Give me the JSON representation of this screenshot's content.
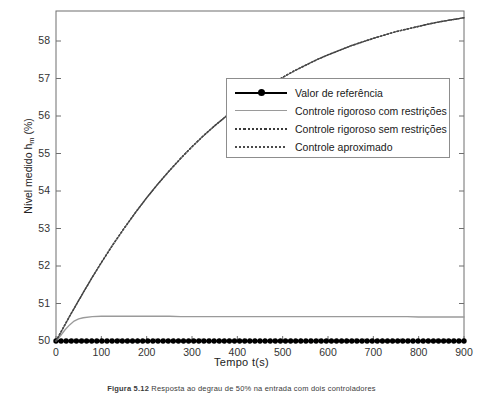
{
  "figure": {
    "caption_label": "Figura 5.12",
    "caption_text": "Resposta ao degrau de 50% na entrada com dois controladores"
  },
  "axes": {
    "x_title": "Tempo  t(s)",
    "y_title_pre": "Nível medido h",
    "y_title_sub": "m",
    "y_title_post": " (%)",
    "x_ticks": [
      "0",
      "100",
      "200",
      "300",
      "400",
      "500",
      "600",
      "700",
      "800",
      "900"
    ],
    "y_ticks": [
      "50",
      "51",
      "52",
      "53",
      "54",
      "55",
      "56",
      "57",
      "58"
    ]
  },
  "legend": {
    "items": [
      {
        "label": "Valor de referência",
        "style": "solid-marker"
      },
      {
        "label": "Controle rigoroso com restrições",
        "style": "gray-solid"
      },
      {
        "label": "Controle rigoroso sem restrições",
        "style": "dotted"
      },
      {
        "label": "Controle aproximado",
        "style": "dotted-fine"
      }
    ]
  },
  "colors": {
    "reference": "#000000",
    "constrained": "#9a9a9a",
    "unconstrained": "#3a3a3a",
    "approximate": "#4a4a4a",
    "axis": "#6f6f6f",
    "background": "#ffffff"
  },
  "chart_data": {
    "type": "line",
    "title": "",
    "xlabel": "Tempo  t(s)",
    "ylabel": "Nível medido h_m (%)",
    "xlim": [
      0,
      900
    ],
    "ylim": [
      50,
      58.8
    ],
    "grid": false,
    "legend_position": "upper-center-right",
    "x": [
      0,
      10,
      20,
      30,
      40,
      50,
      60,
      80,
      100,
      125,
      150,
      175,
      200,
      225,
      250,
      275,
      300,
      325,
      350,
      375,
      400,
      425,
      450,
      475,
      500,
      525,
      550,
      575,
      600,
      625,
      650,
      675,
      700,
      725,
      750,
      775,
      800,
      825,
      850,
      875,
      900
    ],
    "series": [
      {
        "name": "Valor de referência",
        "style": "solid-with-dot-markers",
        "color": "#000000",
        "values": [
          50,
          50,
          50,
          50,
          50,
          50,
          50,
          50,
          50,
          50,
          50,
          50,
          50,
          50,
          50,
          50,
          50,
          50,
          50,
          50,
          50,
          50,
          50,
          50,
          50,
          50,
          50,
          50,
          50,
          50,
          50,
          50,
          50,
          50,
          50,
          50,
          50,
          50,
          50,
          50,
          50
        ]
      },
      {
        "name": "Controle rigoroso com restrições",
        "style": "gray-solid",
        "color": "#9a9a9a",
        "values": [
          50.0,
          50.14,
          50.3,
          50.43,
          50.53,
          50.59,
          50.62,
          50.65,
          50.66,
          50.66,
          50.66,
          50.66,
          50.66,
          50.66,
          50.66,
          50.65,
          50.65,
          50.65,
          50.65,
          50.65,
          50.65,
          50.65,
          50.65,
          50.65,
          50.65,
          50.65,
          50.65,
          50.65,
          50.65,
          50.65,
          50.65,
          50.65,
          50.65,
          50.65,
          50.65,
          50.65,
          50.64,
          50.64,
          50.64,
          50.64,
          50.64
        ]
      },
      {
        "name": "Controle rigoroso sem restrições",
        "style": "dotted",
        "color": "#3a3a3a",
        "values": [
          50.0,
          50.22,
          50.44,
          50.66,
          50.87,
          51.08,
          51.29,
          51.7,
          52.09,
          52.56,
          53.0,
          53.42,
          53.82,
          54.19,
          54.54,
          54.87,
          55.18,
          55.47,
          55.74,
          55.99,
          56.23,
          56.45,
          56.66,
          56.85,
          57.03,
          57.2,
          57.35,
          57.5,
          57.63,
          57.75,
          57.87,
          57.97,
          58.07,
          58.16,
          58.25,
          58.32,
          58.39,
          58.46,
          58.52,
          58.57,
          58.62
        ]
      },
      {
        "name": "Controle aproximado",
        "style": "dotted-fine",
        "color": "#4a4a4a",
        "values": [
          50.0,
          50.22,
          50.44,
          50.66,
          50.87,
          51.08,
          51.29,
          51.7,
          52.09,
          52.56,
          53.0,
          53.42,
          53.82,
          54.19,
          54.54,
          54.87,
          55.18,
          55.47,
          55.74,
          55.99,
          56.23,
          56.45,
          56.66,
          56.85,
          57.03,
          57.2,
          57.35,
          57.5,
          57.63,
          57.75,
          57.87,
          57.97,
          58.07,
          58.16,
          58.25,
          58.32,
          58.39,
          58.46,
          58.52,
          58.57,
          58.62
        ]
      }
    ]
  }
}
